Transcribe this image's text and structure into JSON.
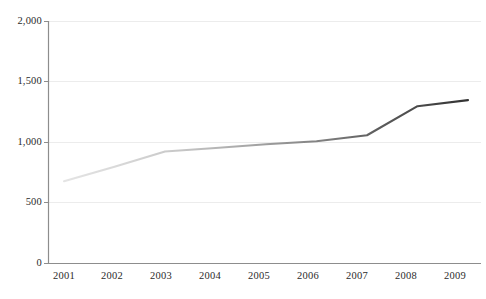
{
  "chart_data": {
    "type": "line",
    "title": "",
    "subtitle": "",
    "xlabel": "",
    "ylabel": "",
    "x": [
      2001,
      2002,
      2003,
      2004,
      2005,
      2006,
      2007,
      2008,
      2009
    ],
    "categories": [
      "2001",
      "2002",
      "2003",
      "2004",
      "2005",
      "2006",
      "2007",
      "2008",
      "2009"
    ],
    "series": [
      {
        "name": "",
        "values": [
          680,
          800,
          925,
          955,
          985,
          1010,
          1060,
          1300,
          1350
        ]
      }
    ],
    "values": [
      680,
      800,
      925,
      955,
      985,
      1010,
      1060,
      1300,
      1350
    ],
    "xlim": [
      2001,
      2009
    ],
    "ylim": [
      0,
      2000
    ],
    "ytick_values": [
      0,
      500,
      1000,
      1500,
      2000
    ],
    "ytick_labels": [
      "0",
      "500",
      "1,000",
      "1,500",
      "2,000"
    ],
    "xtick_labels": [
      "2001",
      "2002",
      "2003",
      "2004",
      "2005",
      "2006",
      "2007",
      "2008",
      "2009"
    ],
    "grid": true,
    "grid_axis": "y",
    "legend": false,
    "legend_position": "none",
    "annotations": [],
    "line_color_start": "#dcdcdc",
    "line_color_end": "#383838",
    "gridline_color": "#e9e9e9",
    "axis_color": "#8a8a8a",
    "background_color": "#ffffff",
    "tick_label_color": "#2b2b2b"
  },
  "axes": {
    "y_ticks": [
      {
        "label": "2,000",
        "value": 2000
      },
      {
        "label": "1,500",
        "value": 1500
      },
      {
        "label": "1,000",
        "value": 1000
      },
      {
        "label": "500",
        "value": 500
      },
      {
        "label": "0",
        "value": 0
      }
    ],
    "x_ticks": [
      {
        "label": "2001",
        "value": 2001
      },
      {
        "label": "2002",
        "value": 2002
      },
      {
        "label": "2003",
        "value": 2003
      },
      {
        "label": "2004",
        "value": 2004
      },
      {
        "label": "2005",
        "value": 2005
      },
      {
        "label": "2006",
        "value": 2006
      },
      {
        "label": "2007",
        "value": 2007
      },
      {
        "label": "2008",
        "value": 2008
      },
      {
        "label": "2009",
        "value": 2009
      }
    ]
  }
}
